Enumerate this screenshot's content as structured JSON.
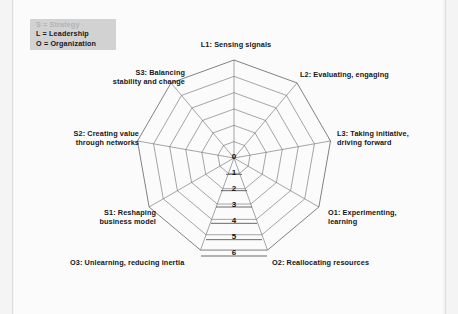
{
  "page": {
    "background_color": "#f4f4f4",
    "sheet_color": "#fbfbfb",
    "rule_color": "#dcdcdc"
  },
  "legend": {
    "name": "dimension-key",
    "background_color": "#d2d2d2",
    "rows": [
      "S = Strategy",
      "L = Leadership",
      "O = Organization"
    ]
  },
  "chart_data": {
    "type": "radar",
    "title": "",
    "subtitle": "",
    "xlabel": "",
    "ylabel": "",
    "grid": true,
    "legend_position": "top-left",
    "rings": 6,
    "rlim": [
      0,
      6
    ],
    "tick_labels": [
      "0",
      "1",
      "2",
      "3",
      "4",
      "5",
      "6"
    ],
    "tick_axis": "downward-vertical",
    "line_color": "#6a6a70",
    "categories": [
      "L1: Sensing signals",
      "L2: Evaluating, engaging",
      "L3: Taking initiative,\ndriving forward",
      "O1: Experimenting,\nlearning",
      "O2: Reallocating resources",
      "O3: Unlearning, reducing inertia",
      "S1: Reshaping\nbusiness model",
      "S2: Creating value\nthrough networks",
      "S3: Balancing\nstability and change"
    ],
    "series": [
      {
        "name": "",
        "values": [
          null,
          null,
          null,
          null,
          null,
          null,
          null,
          null,
          null
        ]
      }
    ],
    "note": "Empty radar template: grid only, no plotted data series."
  },
  "axis_captions": [
    {
      "key": "L1",
      "label": "L1: Sensing signals",
      "left": 192,
      "top": 40,
      "width": 88,
      "align": "center"
    },
    {
      "key": "L2",
      "label": "L2: Evaluating, engaging",
      "left": 300,
      "top": 70,
      "width": 108,
      "align": "left"
    },
    {
      "key": "L3",
      "label": "L3: Taking initiative,\ndriving forward",
      "left": 337,
      "top": 129,
      "width": 90,
      "align": "left"
    },
    {
      "key": "O1",
      "label": "O1: Experimenting,\nlearning",
      "left": 328,
      "top": 208,
      "width": 88,
      "align": "left"
    },
    {
      "key": "O2",
      "label": "O2: Reallocating resources",
      "left": 272,
      "top": 258,
      "width": 116,
      "align": "left"
    },
    {
      "key": "O3",
      "label": "O3: Unlearning, reducing inertia",
      "left": 70,
      "top": 258,
      "width": 130,
      "align": "left"
    },
    {
      "key": "S1",
      "label": "S1: Reshaping\nbusiness model",
      "left": 66,
      "top": 208,
      "width": 90,
      "align": "right"
    },
    {
      "key": "S2",
      "label": "S2: Creating value\nthrough networks",
      "left": 46,
      "top": 129,
      "width": 93,
      "align": "right"
    },
    {
      "key": "S3",
      "label": "S3: Balancing\nstability and change",
      "left": 84,
      "top": 68,
      "width": 101,
      "align": "right"
    }
  ],
  "tick_positions": [
    {
      "label": "0",
      "left": 227,
      "top": 152
    },
    {
      "label": "1",
      "left": 227,
      "top": 168
    },
    {
      "label": "2",
      "left": 227,
      "top": 184
    },
    {
      "label": "3",
      "left": 227,
      "top": 200
    },
    {
      "label": "4",
      "left": 227,
      "top": 216
    },
    {
      "label": "5",
      "left": 227,
      "top": 232
    },
    {
      "label": "6",
      "left": 227,
      "top": 248
    }
  ]
}
